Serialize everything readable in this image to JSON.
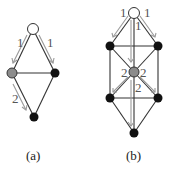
{
  "figure": {
    "panels": [
      {
        "id": "a",
        "caption": "(a)",
        "nodes": [
          {
            "id": "top",
            "x": 33,
            "y": 29,
            "fill": "#ffffff"
          },
          {
            "id": "left",
            "x": 12,
            "y": 73,
            "fill": "#8c8c8c"
          },
          {
            "id": "right",
            "x": 55,
            "y": 73,
            "fill": "#111111"
          },
          {
            "id": "bottom",
            "x": 34,
            "y": 117,
            "fill": "#111111"
          }
        ],
        "edges": [
          [
            "top",
            "left"
          ],
          [
            "top",
            "right"
          ],
          [
            "left",
            "right"
          ],
          [
            "left",
            "bottom"
          ],
          [
            "right",
            "bottom"
          ]
        ],
        "flow_labels": [
          {
            "text": "1",
            "x": 17,
            "y": 47
          },
          {
            "text": "1",
            "x": 47,
            "y": 47
          },
          {
            "text": "2",
            "x": 12,
            "y": 103
          }
        ]
      },
      {
        "id": "b",
        "caption": "(b)",
        "nodes": [
          {
            "id": "top",
            "x": 134,
            "y": 13,
            "fill": "#ffffff"
          },
          {
            "id": "ul",
            "x": 110,
            "y": 46,
            "fill": "#111111"
          },
          {
            "id": "ur",
            "x": 158,
            "y": 46,
            "fill": "#111111"
          },
          {
            "id": "center",
            "x": 134,
            "y": 72,
            "fill": "#8c8c8c"
          },
          {
            "id": "ll",
            "x": 110,
            "y": 98,
            "fill": "#111111"
          },
          {
            "id": "lr",
            "x": 158,
            "y": 98,
            "fill": "#111111"
          },
          {
            "id": "bottom",
            "x": 134,
            "y": 133,
            "fill": "#111111"
          }
        ],
        "flow_labels": [
          {
            "text": "1",
            "x": 121,
            "y": 17
          },
          {
            "text": "1",
            "x": 144,
            "y": 17
          },
          {
            "text": "1",
            "x": 136,
            "y": 29
          },
          {
            "text": "2",
            "x": 122,
            "y": 76
          },
          {
            "text": "2",
            "x": 140,
            "y": 76
          },
          {
            "text": "2",
            "x": 136,
            "y": 91
          }
        ]
      }
    ]
  }
}
